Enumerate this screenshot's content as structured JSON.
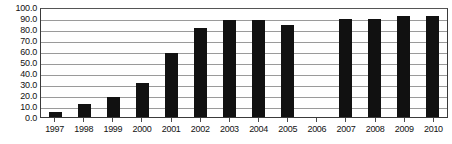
{
  "chart_data": {
    "type": "bar",
    "title": "",
    "subtitle": "",
    "xlabel": "",
    "ylabel": "",
    "categories": [
      "1997",
      "1998",
      "1999",
      "2000",
      "2001",
      "2002",
      "2003",
      "2004",
      "2005",
      "2006",
      "2007",
      "2008",
      "2009",
      "2010"
    ],
    "values": [
      5.0,
      11.5,
      18.5,
      31.0,
      58.5,
      81.0,
      88.0,
      88.0,
      84.0,
      null,
      89.0,
      89.0,
      91.5,
      91.5
    ],
    "series": [
      {
        "name": "",
        "values": [
          5.0,
          11.5,
          18.5,
          31.0,
          58.5,
          81.0,
          88.0,
          88.0,
          84.0,
          null,
          89.0,
          89.0,
          91.5,
          91.5
        ]
      }
    ],
    "ylim": [
      0.0,
      100.0
    ],
    "ytick_values": [
      0.0,
      10.0,
      20.0,
      30.0,
      40.0,
      50.0,
      60.0,
      70.0,
      80.0,
      90.0,
      100.0
    ],
    "ytick_labels": [
      "0.0",
      "10.0",
      "20.0",
      "30.0",
      "40.0",
      "50.0",
      "60.0",
      "70.0",
      "80.0",
      "90.0",
      "100.0"
    ],
    "grid": true,
    "grid_axis": "y",
    "legend": false,
    "legend_position": "none",
    "bar_color": "#111111",
    "gridline_color": "#9a9a9a",
    "axis_color": "#3a3a3a",
    "background_color": "#ffffff",
    "missing_categories": [
      "2006"
    ],
    "annotations": []
  }
}
